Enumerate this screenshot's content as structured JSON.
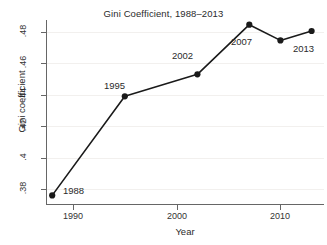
{
  "chart_data": {
    "type": "line",
    "title": "Gini Coefficient, 1988–2013",
    "xlabel": "Year",
    "ylabel": "Gini coefficient",
    "x": [
      1988,
      1995,
      2002,
      2007,
      2010,
      2013
    ],
    "values": [
      0.376,
      0.439,
      0.453,
      0.4845,
      0.4745,
      0.4805
    ],
    "point_labels": [
      "1988",
      "1995",
      "2002",
      "2007",
      "2013"
    ],
    "xlim": [
      1987.4,
      2014.2
    ],
    "ylim": [
      0.3705,
      0.4875
    ],
    "xticks": [
      1990,
      2000,
      2010
    ],
    "xtick_labels": [
      "1990",
      "2000",
      "2010"
    ],
    "yticks": [
      0.38,
      0.4,
      0.42,
      0.44,
      0.46,
      0.48
    ],
    "ytick_labels": [
      ".38",
      ".4",
      ".42",
      ".44",
      ".46",
      ".48"
    ],
    "grid": "horizontal-faint",
    "legend": "none",
    "marker": "filled-circle",
    "line_color": "#1a1a1a",
    "marker_color": "#1a1a1a",
    "grid_color": "#f2f0ee",
    "axis_color": "#666666",
    "background": "#ffffff"
  },
  "annotations": [
    {
      "text": "1988",
      "x": 63,
      "y": 185
    },
    {
      "text": "1995",
      "x": 104,
      "y": 80
    },
    {
      "text": "2002",
      "x": 172,
      "y": 50
    },
    {
      "text": "2007",
      "x": 231,
      "y": 36
    },
    {
      "text": "2013",
      "x": 293,
      "y": 43
    }
  ]
}
